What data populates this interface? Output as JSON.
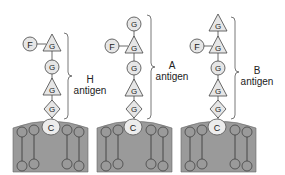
{
  "diagram": {
    "colors": {
      "membrane_fill": "#9a9a9a",
      "membrane_stroke": "#555555",
      "sugar_fill": "#e6e6e6",
      "sugar_stroke": "#444444",
      "ceramide_fill": "#ececec",
      "text": "#222222"
    },
    "legend_symbols": {
      "F": "fucose",
      "G": "sugar residue",
      "C": "ceramide/carrier"
    },
    "antigens": [
      {
        "name": "H",
        "label_line1": "H",
        "label_line2": "antigen",
        "chain": [
          {
            "shape": "triangle",
            "letter": "G",
            "branch": "F"
          },
          {
            "shape": "circle",
            "letter": "G"
          },
          {
            "shape": "triangle",
            "letter": "G"
          },
          {
            "shape": "diamond",
            "letter": "G"
          }
        ],
        "anchor": "C"
      },
      {
        "name": "A",
        "label_line1": "A",
        "label_line2": "antigen",
        "chain": [
          {
            "shape": "circle",
            "letter": "G"
          },
          {
            "shape": "triangle",
            "letter": "G",
            "branch": "F"
          },
          {
            "shape": "circle",
            "letter": "G"
          },
          {
            "shape": "triangle",
            "letter": "G"
          },
          {
            "shape": "diamond",
            "letter": "G"
          }
        ],
        "anchor": "C"
      },
      {
        "name": "B",
        "label_line1": "B",
        "label_line2": "antigen",
        "chain": [
          {
            "shape": "triangle",
            "letter": "G"
          },
          {
            "shape": "triangle",
            "letter": "G",
            "branch": "F"
          },
          {
            "shape": "circle",
            "letter": "G"
          },
          {
            "shape": "triangle",
            "letter": "G"
          },
          {
            "shape": "diamond",
            "letter": "G"
          }
        ],
        "anchor": "C"
      }
    ]
  }
}
